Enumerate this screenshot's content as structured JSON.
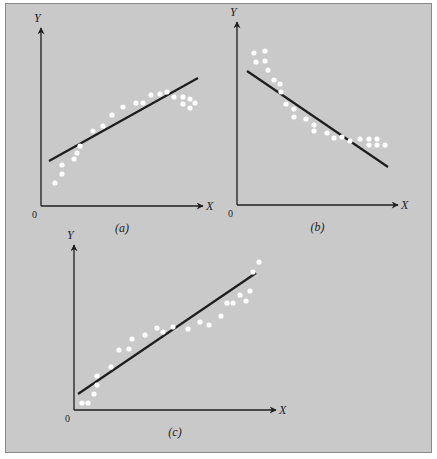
{
  "chart_data": [
    {
      "type": "scatter",
      "title": "",
      "caption": "(a)",
      "xlabel": "X",
      "ylabel": "Y",
      "origin_label": "0",
      "trend": "linear fit to concave (curvilinear) data",
      "axes": {
        "origin": [
          41,
          206
        ],
        "x_end": 203,
        "y_end": 28
      },
      "points": [
        [
          55,
          183
        ],
        [
          62,
          174
        ],
        [
          62,
          165
        ],
        [
          74,
          159
        ],
        [
          77,
          153
        ],
        [
          80,
          146
        ],
        [
          93,
          131
        ],
        [
          103,
          126
        ],
        [
          112,
          115
        ],
        [
          123,
          107
        ],
        [
          136,
          103
        ],
        [
          143,
          103
        ],
        [
          151,
          95
        ],
        [
          160,
          94
        ],
        [
          167,
          92
        ],
        [
          174,
          97
        ],
        [
          183,
          97
        ],
        [
          183,
          104
        ],
        [
          190,
          99
        ],
        [
          190,
          108
        ],
        [
          195,
          103
        ]
      ],
      "fit_line": [
        [
          49,
          161
        ],
        [
          198,
          78
        ]
      ]
    },
    {
      "type": "scatter",
      "title": "",
      "caption": "(b)",
      "xlabel": "X",
      "ylabel": "Y",
      "origin_label": "0",
      "trend": "negative linear fit to convex (curvilinear) data",
      "axes": {
        "origin": [
          237,
          205
        ],
        "x_end": 398,
        "y_end": 22
      },
      "points": [
        [
          254,
          53
        ],
        [
          256,
          62
        ],
        [
          265,
          51
        ],
        [
          265,
          61
        ],
        [
          268,
          70
        ],
        [
          274,
          80
        ],
        [
          280,
          84
        ],
        [
          281,
          92
        ],
        [
          286,
          104
        ],
        [
          294,
          109
        ],
        [
          294,
          117
        ],
        [
          306,
          119
        ],
        [
          314,
          125
        ],
        [
          314,
          131
        ],
        [
          327,
          133
        ],
        [
          334,
          138
        ],
        [
          342,
          137
        ],
        [
          350,
          141
        ],
        [
          360,
          139
        ],
        [
          369,
          139
        ],
        [
          377,
          139
        ],
        [
          369,
          145
        ],
        [
          377,
          145
        ],
        [
          385,
          145
        ]
      ],
      "fit_line": [
        [
          247,
          71
        ],
        [
          388,
          167
        ]
      ]
    },
    {
      "type": "scatter",
      "title": "",
      "caption": "(c)",
      "xlabel": "X",
      "ylabel": "Y",
      "origin_label": "0",
      "trend": "positive linear fit to linear data",
      "axes": {
        "origin": [
          74,
          410
        ],
        "x_end": 276,
        "y_end": 245
      },
      "points": [
        [
          82,
          403
        ],
        [
          88,
          403
        ],
        [
          94,
          394
        ],
        [
          97,
          385
        ],
        [
          97,
          376
        ],
        [
          111,
          367
        ],
        [
          119,
          350
        ],
        [
          129,
          349
        ],
        [
          132,
          339
        ],
        [
          145,
          335
        ],
        [
          157,
          328
        ],
        [
          163,
          332
        ],
        [
          173,
          327
        ],
        [
          188,
          329
        ],
        [
          200,
          322
        ],
        [
          209,
          325
        ],
        [
          221,
          316
        ],
        [
          227,
          303
        ],
        [
          233,
          303
        ],
        [
          240,
          295
        ],
        [
          246,
          301
        ],
        [
          250,
          291
        ],
        [
          253,
          272
        ],
        [
          259,
          262
        ]
      ],
      "fit_line": [
        [
          78,
          394
        ],
        [
          256,
          273
        ]
      ]
    }
  ],
  "colors": {
    "background": "#c9c9c9",
    "border": "#8a8a8a",
    "axis": "#1e1e1e",
    "line": "#1e1e1e",
    "points": "#ffffff"
  }
}
